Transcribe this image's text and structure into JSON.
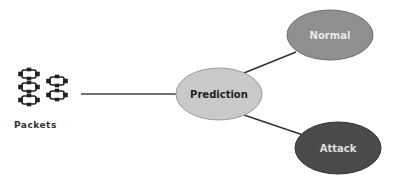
{
  "diagram": {
    "source": {
      "label": "Packets",
      "icon": "network-packets-icon"
    },
    "center": {
      "label": "Prediction",
      "fill": "#c9c9c9",
      "text_color": "#222222"
    },
    "outputs": [
      {
        "label": "Normal",
        "fill": "#8f8f8f",
        "text_color": "#e8e8e8"
      },
      {
        "label": "Attack",
        "fill": "#4a4a4a",
        "text_color": "#e0e0e0"
      }
    ],
    "edges": [
      {
        "from": "Packets",
        "to": "Prediction"
      },
      {
        "from": "Prediction",
        "to": "Normal"
      },
      {
        "from": "Prediction",
        "to": "Attack"
      }
    ]
  }
}
